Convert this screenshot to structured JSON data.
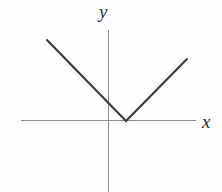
{
  "figure": {
    "background_color": "#fdfdfd",
    "width": 222,
    "height": 192,
    "axis_color": "#8a8a8a",
    "curve_color": "#3a3a3a",
    "axis_stroke_width": 1,
    "curve_stroke_width": 2.1,
    "y_axis_label": "y",
    "x_axis_label": "x"
  },
  "chart_data": {
    "type": "line",
    "title": "",
    "xlabel": "x",
    "ylabel": "y",
    "grid": false,
    "legend_position": "none",
    "axis_pixels": {
      "x_axis_y": 120,
      "x_axis_x_start": 21,
      "x_axis_x_end": 196,
      "y_axis_x": 108,
      "y_axis_y_start": 30,
      "y_axis_y_end": 192,
      "origin": [
        108,
        120
      ]
    },
    "series": [
      {
        "name": "V curve",
        "points_pixels": [
          [
            47,
            40
          ],
          [
            126,
            121
          ],
          [
            187,
            59
          ]
        ],
        "x": [
          -3.05,
          0.72,
          3.63
        ],
        "values": [
          3.81,
          0.0,
          2.9
        ],
        "segments": [
          {
            "name": "left-branch",
            "from": [
              -3.05,
              3.81
            ],
            "to": [
              0.72,
              0.0
            ],
            "slope": -1.01
          },
          {
            "name": "right-branch",
            "from": [
              0.72,
              0.0
            ],
            "to": [
              3.63,
              2.9
            ],
            "slope": 1.0
          }
        ]
      }
    ],
    "vertex": {
      "x": 0.72,
      "y": 0.0
    },
    "xlim": [
      -4.15,
      4.2
    ],
    "ylim": [
      -3.4,
      4.25
    ],
    "tick_labels": {
      "x": [],
      "y": []
    }
  }
}
